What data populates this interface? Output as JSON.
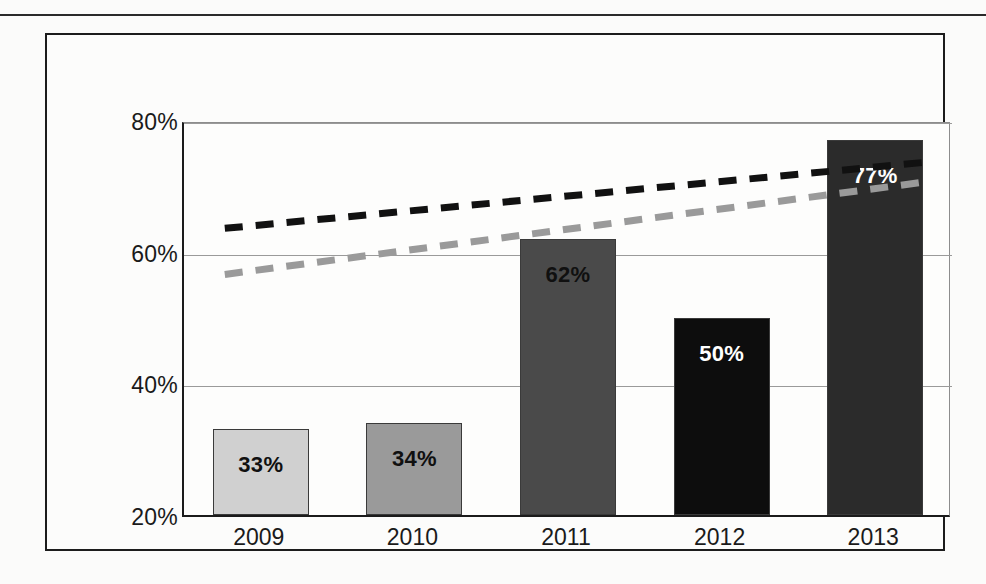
{
  "chart_data": {
    "type": "bar",
    "title": "",
    "subtitle": "",
    "xlabel": "",
    "ylabel": "",
    "categories": [
      "2009",
      "2010",
      "2011",
      "2012",
      "2013"
    ],
    "values": [
      33,
      34,
      62,
      50,
      77
    ],
    "value_labels": [
      "33%",
      "34%",
      "62%",
      "50%",
      "77%"
    ],
    "bar_colors": [
      "#d0d0d0",
      "#9a9a9a",
      "#4a4a4a",
      "#0d0d0d",
      "#2b2b2b"
    ],
    "bar_label_colors": [
      "#101010",
      "#101010",
      "#101010",
      "#ffffff",
      "#ffffff"
    ],
    "ylim": [
      20,
      80
    ],
    "yticks": [
      20,
      40,
      60,
      80
    ],
    "ytick_labels": [
      "20%",
      "40%",
      "60%",
      "80%"
    ],
    "grid": true,
    "legend": "none",
    "series": [
      {
        "name": "bars",
        "kind": "bar",
        "values": [
          33,
          34,
          62,
          50,
          77
        ]
      },
      {
        "name": "black-dashed-trendline",
        "kind": "line",
        "style": "dashed",
        "color": "#111111",
        "x_start_category": "2009",
        "x_end_category": "2013",
        "y_start": 64,
        "y_end": 74
      },
      {
        "name": "gray-dashed-trendline",
        "kind": "line",
        "style": "dashed",
        "color": "#9a9a9a",
        "x_start_category": "2009",
        "x_end_category": "2013",
        "y_start": 57,
        "y_end": 71
      }
    ]
  },
  "figure": {
    "frame_color": "#1c1c1c",
    "background": "#fcfcfb",
    "top_rule_color": "#2a2a2a"
  }
}
